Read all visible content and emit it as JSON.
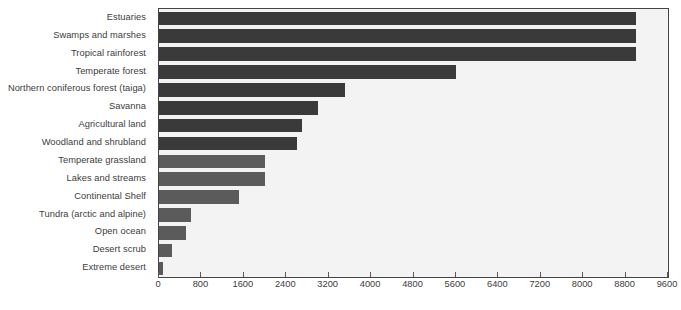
{
  "chart_data": {
    "type": "bar",
    "orientation": "horizontal",
    "title": "",
    "xlabel": "",
    "ylabel": "",
    "xlim": [
      0,
      9600
    ],
    "ylim": null,
    "grid": false,
    "legend": null,
    "xticks": [
      0,
      800,
      1600,
      2400,
      3200,
      4000,
      4800,
      5600,
      6400,
      7200,
      8000,
      8800,
      9600
    ],
    "xtick_labels": [
      "0",
      "800",
      "1600",
      "2400",
      "3200",
      "4000",
      "4800",
      "5600",
      "6400",
      "7200",
      "8000",
      "8800",
      "9600"
    ],
    "categories": [
      "Estuaries",
      "Swamps and marshes",
      "Tropical rainforest",
      "Temperate forest",
      "Northern coniferous forest (taiga)",
      "Savanna",
      "Agricultural land",
      "Woodland and shrubland",
      "Temperate grassland",
      "Lakes and streams",
      "Continental Shelf",
      "Tundra (arctic and alpine)",
      "Open ocean",
      "Desert scrub",
      "Extreme desert"
    ],
    "values": [
      9000,
      9000,
      9000,
      5600,
      3500,
      3000,
      2700,
      2600,
      2000,
      2000,
      1500,
      600,
      500,
      250,
      70
    ],
    "bar_colors": [
      "#3a3a3a",
      "#3a3a3a",
      "#3a3a3a",
      "#3a3a3a",
      "#3a3a3a",
      "#3a3a3a",
      "#3a3a3a",
      "#3a3a3a",
      "#5b5b5b",
      "#5b5b5b",
      "#5b5b5b",
      "#5b5b5b",
      "#5b5b5b",
      "#5b5b5b",
      "#5b5b5b"
    ],
    "plot_background": "#f3f3f3",
    "axis_color": "#444444",
    "text_color": "#3c3c3c"
  }
}
